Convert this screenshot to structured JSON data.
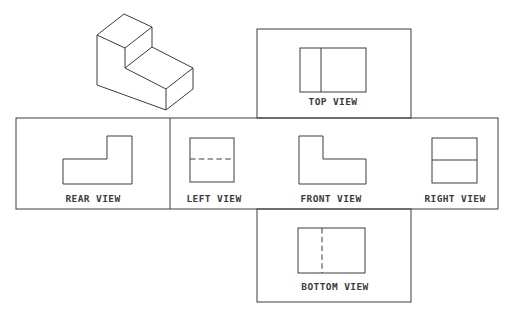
{
  "colors": {
    "line": "#3c3c3c",
    "background": "#ffffff"
  },
  "views": {
    "top": {
      "label": "TOP VIEW"
    },
    "rear": {
      "label": "REAR VIEW"
    },
    "left": {
      "label": "LEFT VIEW"
    },
    "front": {
      "label": "FRONT VIEW"
    },
    "right": {
      "label": "RIGHT VIEW"
    },
    "bottom": {
      "label": "BOTTOM VIEW"
    }
  }
}
